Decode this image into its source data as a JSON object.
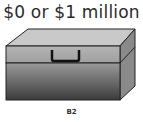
{
  "title": "$0 or $1 million",
  "caption": "B2"
}
